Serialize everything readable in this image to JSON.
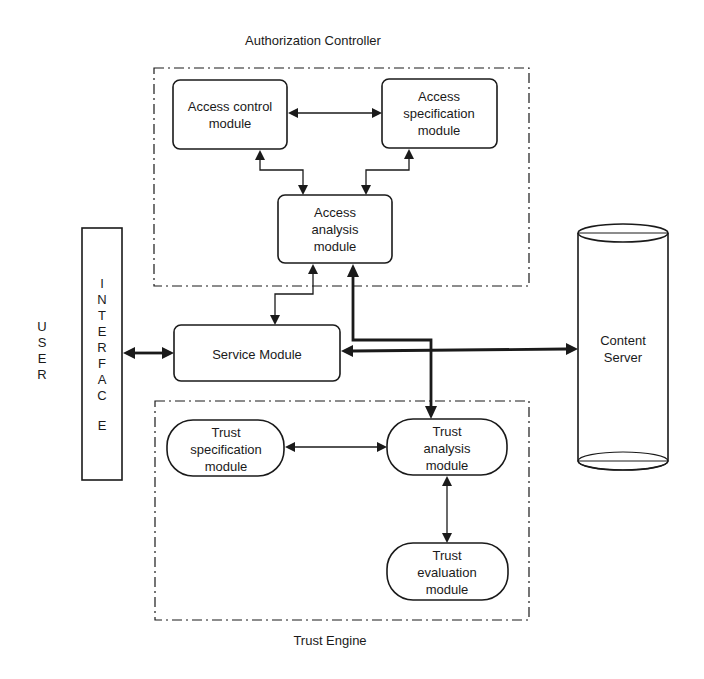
{
  "diagram": {
    "groups": {
      "authorization_controller": "Authorization Controller",
      "trust_engine": "Trust Engine"
    },
    "nodes": {
      "access_control": [
        "Access control",
        "module"
      ],
      "access_specification": [
        "Access",
        "specification",
        "module"
      ],
      "access_analysis": [
        "Access",
        "analysis",
        "module"
      ],
      "service_module": "Service Module",
      "trust_specification": [
        "Trust",
        "specification",
        "module"
      ],
      "trust_analysis": [
        "Trust",
        "analysis",
        "module"
      ],
      "trust_evaluation": [
        "Trust",
        "evaluation",
        "module"
      ],
      "content_server": [
        "Content",
        "Server"
      ],
      "interface": [
        "I",
        "N",
        "T",
        "E",
        "R",
        "F",
        "A",
        "C",
        "E"
      ],
      "user": [
        "U",
        "S",
        "E",
        "R"
      ]
    },
    "edges": [
      {
        "from": "Access control module",
        "to": "Access specification module",
        "style": "thin",
        "direction": "both"
      },
      {
        "from": "Access control module",
        "to": "Access analysis module",
        "style": "thin",
        "direction": "both"
      },
      {
        "from": "Access specification module",
        "to": "Access analysis module",
        "style": "thin",
        "direction": "both"
      },
      {
        "from": "Service Module",
        "to": "Access analysis module",
        "style": "thin",
        "direction": "both"
      },
      {
        "from": "Interface",
        "to": "Service Module",
        "style": "thick",
        "direction": "both"
      },
      {
        "from": "Service Module",
        "to": "Content Server",
        "style": "thick",
        "direction": "both"
      },
      {
        "from": "Access analysis module",
        "to": "Trust analysis module",
        "style": "thick",
        "direction": "both"
      },
      {
        "from": "Trust specification module",
        "to": "Trust analysis module",
        "style": "thin",
        "direction": "both"
      },
      {
        "from": "Trust analysis module",
        "to": "Trust evaluation module",
        "style": "thin",
        "direction": "both"
      }
    ]
  }
}
